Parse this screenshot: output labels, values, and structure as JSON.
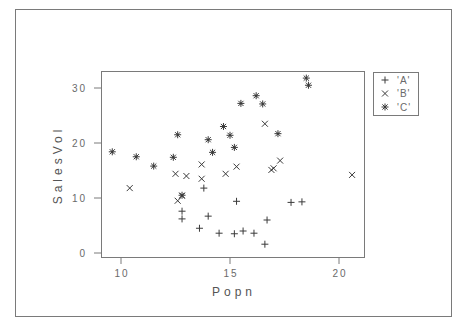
{
  "chart_data": {
    "type": "scatter",
    "title": "",
    "xlabel": "Popn",
    "ylabel": "SalesVol",
    "xlim": [
      9.1,
      21.2
    ],
    "ylim": [
      -0.7,
      33.2
    ],
    "xticks": [
      10,
      15,
      20
    ],
    "yticks": [
      0,
      10,
      20,
      30
    ],
    "xtick_labels": [
      "10",
      "15",
      "20"
    ],
    "ytick_labels": [
      "0",
      "10",
      "20",
      "30"
    ],
    "grid": false,
    "legend_position": "top-right-outside",
    "series": [
      {
        "name": "'A'",
        "marker": "plus",
        "points": [
          [
            12.8,
            7.6
          ],
          [
            12.8,
            6.2
          ],
          [
            13.8,
            11.8
          ],
          [
            14.0,
            6.7
          ],
          [
            13.6,
            4.5
          ],
          [
            14.5,
            3.6
          ],
          [
            15.2,
            3.5
          ],
          [
            15.3,
            9.4
          ],
          [
            15.6,
            4.0
          ],
          [
            16.1,
            3.6
          ],
          [
            16.7,
            6.0
          ],
          [
            16.6,
            1.6
          ],
          [
            17.8,
            9.2
          ],
          [
            18.3,
            9.3
          ]
        ]
      },
      {
        "name": "'B'",
        "marker": "x",
        "points": [
          [
            10.4,
            11.8
          ],
          [
            12.5,
            14.4
          ],
          [
            12.6,
            9.5
          ],
          [
            12.8,
            10.4
          ],
          [
            13.0,
            14.0
          ],
          [
            13.7,
            16.1
          ],
          [
            13.7,
            13.5
          ],
          [
            14.8,
            14.4
          ],
          [
            15.3,
            15.7
          ],
          [
            16.6,
            23.5
          ],
          [
            16.9,
            15.1
          ],
          [
            17.0,
            15.4
          ],
          [
            17.3,
            16.8
          ],
          [
            20.6,
            14.2
          ]
        ]
      },
      {
        "name": "'C'",
        "marker": "asterisk",
        "points": [
          [
            9.6,
            18.4
          ],
          [
            10.7,
            17.5
          ],
          [
            11.5,
            15.8
          ],
          [
            12.4,
            17.4
          ],
          [
            12.6,
            21.5
          ],
          [
            12.8,
            10.5
          ],
          [
            14.0,
            20.6
          ],
          [
            14.2,
            18.3
          ],
          [
            14.7,
            23.0
          ],
          [
            15.0,
            21.4
          ],
          [
            15.2,
            19.2
          ],
          [
            15.5,
            27.2
          ],
          [
            16.2,
            28.6
          ],
          [
            16.5,
            27.1
          ],
          [
            17.2,
            21.7
          ],
          [
            18.5,
            31.8
          ],
          [
            18.6,
            30.5
          ]
        ]
      }
    ]
  },
  "colors": {
    "marker": "#3a3a3a",
    "axis": "#7a7a7a",
    "text": "#6a6a6a"
  }
}
